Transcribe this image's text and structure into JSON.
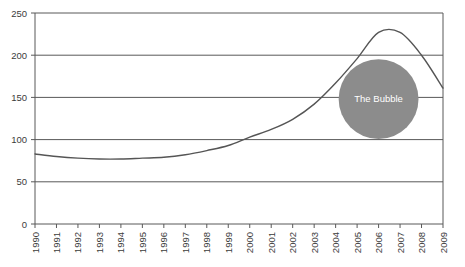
{
  "chart_data": {
    "type": "line",
    "title": "",
    "subtitle": "",
    "xlabel": "",
    "ylabel": "",
    "grid": true,
    "legend": null,
    "xlim": [
      "1990",
      "2009"
    ],
    "ylim": [
      0,
      250
    ],
    "y_ticks": [
      0,
      50,
      100,
      150,
      200,
      250
    ],
    "categories": [
      "1990",
      "1991",
      "1992",
      "1993",
      "1994",
      "1995",
      "1996",
      "1997",
      "1998",
      "1999",
      "2000",
      "2001",
      "2002",
      "2003",
      "2004",
      "2005",
      "2006",
      "2007",
      "2008",
      "2009"
    ],
    "series": [
      {
        "name": "index",
        "values": [
          83,
          80,
          78,
          77,
          77,
          78,
          79,
          82,
          87,
          93,
          103,
          112,
          124,
          142,
          167,
          196,
          227,
          227,
          200,
          161
        ]
      }
    ],
    "annotations": [
      {
        "name": "bubble",
        "label": "The Bubble",
        "shape": "circle",
        "x_value": "2006",
        "y_value": 148,
        "radius_y_units": 52,
        "fill": "#8c8c8c",
        "text_color": "#ffffff"
      }
    ],
    "colors": {
      "line": "#555555",
      "gridline": "#595959",
      "axis": "#595959",
      "tick_text": "#3b3b3b",
      "plot_background": "#ffffff",
      "bubble_fill": "#8c8c8c"
    }
  },
  "axis": {
    "y_labels": [
      "250",
      "200",
      "150",
      "100",
      "50",
      "0"
    ],
    "x_labels": [
      "1990",
      "1991",
      "1992",
      "1993",
      "1994",
      "1995",
      "1996",
      "1997",
      "1998",
      "1999",
      "2000",
      "2001",
      "2002",
      "2003",
      "2004",
      "2005",
      "2006",
      "2007",
      "2008",
      "2009"
    ]
  },
  "annotation": {
    "bubble_label": "The Bubble"
  }
}
